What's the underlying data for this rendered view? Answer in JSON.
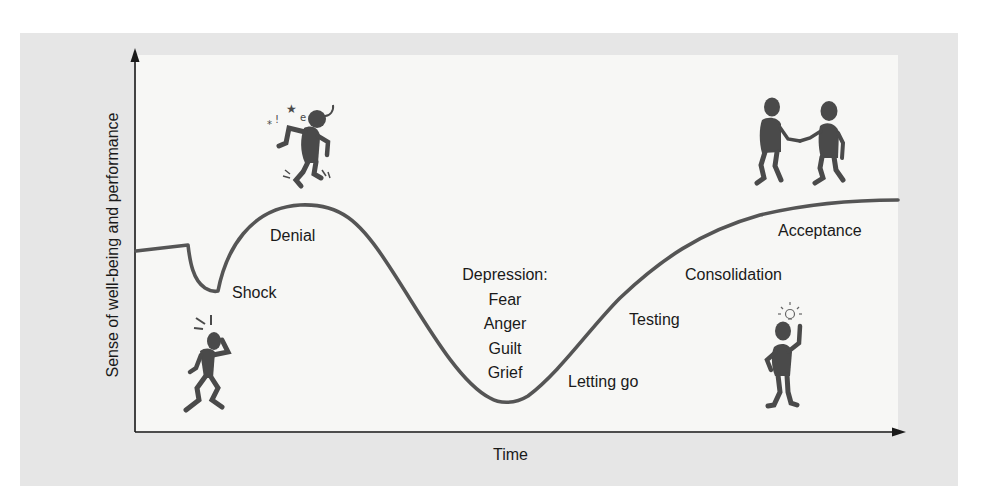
{
  "diagram": {
    "y_axis_label": "Sense of well-being and performance",
    "x_axis_label": "Time",
    "stages": [
      {
        "id": "shock",
        "label": "Shock"
      },
      {
        "id": "denial",
        "label": "Denial"
      },
      {
        "id": "depression",
        "label": "Depression:",
        "sub_items": [
          "Fear",
          "Anger",
          "Guilt",
          "Grief"
        ]
      },
      {
        "id": "letting-go",
        "label": "Letting go"
      },
      {
        "id": "testing",
        "label": "Testing"
      },
      {
        "id": "consolidation",
        "label": "Consolidation"
      },
      {
        "id": "acceptance",
        "label": "Acceptance"
      }
    ],
    "illustrations": [
      {
        "id": "shocked-person",
        "icon": "shocked-person-icon",
        "near": "Shock"
      },
      {
        "id": "dizzy-person",
        "icon": "dizzy-person-icon",
        "near": "Denial"
      },
      {
        "id": "handshake-people",
        "icon": "handshake-icon",
        "near": "Acceptance"
      },
      {
        "id": "idea-person",
        "icon": "lightbulb-person-icon",
        "near": "Consolidation"
      }
    ],
    "colors": {
      "outer_panel": "#e6e6e6",
      "plot_background": "#f7f7f5",
      "curve": "#555555",
      "axis": "#1a1a1a",
      "figures": "#4a4a4a",
      "text": "#1a1a1a"
    }
  }
}
